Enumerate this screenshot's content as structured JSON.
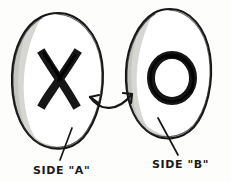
{
  "diagram": {
    "background_color": "#fdfdfc",
    "ink_color": "#161616",
    "shade_color": "#c9c9c6",
    "shade_color_light": "#e4e4e1",
    "shapes": [
      {
        "id": "blob-left",
        "name": "egg-shape-side-a",
        "symbol": "X",
        "symbol_name": "x-mark",
        "label": "SIDE \"A\"",
        "fill": "#ffffff",
        "stroke": "#161616"
      },
      {
        "id": "blob-right",
        "name": "egg-shape-side-b",
        "symbol": "O",
        "symbol_name": "o-mark",
        "label": "SIDE \"B\"",
        "fill": "#ffffff",
        "stroke": "#161616"
      }
    ],
    "connector": {
      "name": "double-headed-arrow",
      "style": "curved",
      "heads": 2,
      "direction": "bidirectional"
    },
    "labels": {
      "left": "SIDE \"A\"",
      "right": "SIDE \"B\""
    }
  }
}
